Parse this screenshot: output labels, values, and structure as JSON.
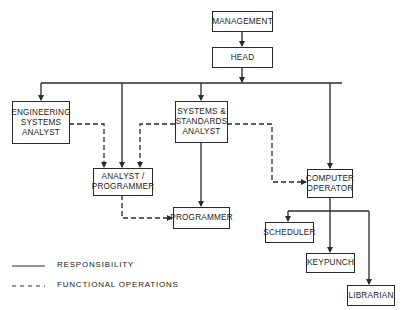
{
  "diagram": {
    "nodes": [
      {
        "id": "management",
        "label": "MANAGEMENT"
      },
      {
        "id": "head",
        "label": "HEAD"
      },
      {
        "id": "engineering_systems_analyst",
        "label": "ENGINEERING\nSYSTEMS\nANALYST"
      },
      {
        "id": "systems_standards_analyst",
        "label": "SYSTEMS &\nSTANDARDS\nANALYST"
      },
      {
        "id": "analyst_programmer",
        "label": "ANALYST /\nPROGRAMMER"
      },
      {
        "id": "programmer",
        "label": "PROGRAMMER"
      },
      {
        "id": "computer_operator",
        "label": "COMPUTER\nOPERATOR"
      },
      {
        "id": "scheduler",
        "label": "SCHEDULER"
      },
      {
        "id": "keypunch",
        "label": "KEYPUNCH"
      },
      {
        "id": "librarian",
        "label": "LIBRARIAN"
      }
    ],
    "edges": [
      {
        "from": "management",
        "to": "head",
        "type": "responsibility"
      },
      {
        "from": "head",
        "to": "engineering_systems_analyst",
        "type": "responsibility"
      },
      {
        "from": "head",
        "to": "analyst_programmer",
        "type": "responsibility"
      },
      {
        "from": "head",
        "to": "systems_standards_analyst",
        "type": "responsibility"
      },
      {
        "from": "head",
        "to": "computer_operator",
        "type": "responsibility"
      },
      {
        "from": "engineering_systems_analyst",
        "to": "analyst_programmer",
        "type": "functional"
      },
      {
        "from": "systems_standards_analyst",
        "to": "analyst_programmer",
        "type": "functional"
      },
      {
        "from": "systems_standards_analyst",
        "to": "computer_operator",
        "type": "functional"
      },
      {
        "from": "systems_standards_analyst",
        "to": "programmer",
        "type": "responsibility"
      },
      {
        "from": "analyst_programmer",
        "to": "programmer",
        "type": "functional"
      },
      {
        "from": "computer_operator",
        "to": "scheduler",
        "type": "responsibility"
      },
      {
        "from": "computer_operator",
        "to": "keypunch",
        "type": "responsibility"
      },
      {
        "from": "computer_operator",
        "to": "librarian",
        "type": "responsibility"
      }
    ]
  },
  "legend": {
    "responsibility": "RESPONSIBILITY",
    "functional": "FUNCTIONAL OPERATIONS"
  },
  "colors": {
    "line": "#2a2a2a",
    "background": "#ffffff"
  }
}
